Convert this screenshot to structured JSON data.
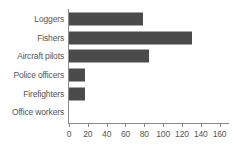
{
  "chart_data": {
    "type": "bar",
    "orientation": "horizontal",
    "title": "",
    "subtitle": "",
    "xlabel": "",
    "ylabel": "",
    "categories": [
      "Loggers",
      "Fishers",
      "Aircraft pilots",
      "Police officers",
      "Firefighters",
      "Office workers"
    ],
    "values": [
      79,
      131,
      85,
      17,
      17,
      0
    ],
    "xlim": [
      0,
      170
    ],
    "xticks": [
      0,
      20,
      40,
      60,
      80,
      100,
      120,
      140,
      160
    ],
    "xticklabels": [
      "0",
      "20",
      "40",
      "60",
      "80",
      "100",
      "120",
      "140",
      "160"
    ],
    "grid": false,
    "legend": null,
    "bar_color": "#4b4b4b",
    "axis_color": "#8a8a8a",
    "text_color": "#555555",
    "background_color": "#ffffff"
  }
}
